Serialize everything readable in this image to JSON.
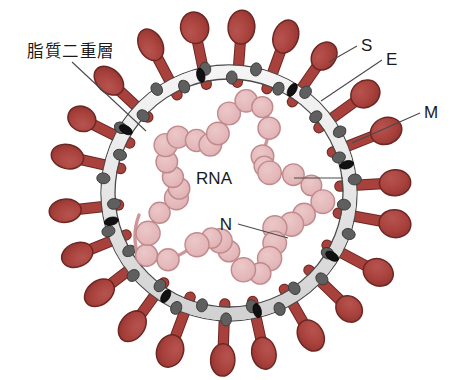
{
  "diagram": {
    "background_color": "#ffffff"
  },
  "labels": {
    "lipid_bilayer": "脂質二重層",
    "spike": "S",
    "envelope": "E",
    "membrane": "M",
    "rna": "RNA",
    "nucleocapsid": "N"
  },
  "colors": {
    "spike_fill": "#a8413c",
    "spike_stroke": "#6d2723",
    "membrane_band": "#e9e9e9",
    "membrane_stroke": "#4a4a4a",
    "m_protein": "#5f5f5f",
    "e_protein": "#111111",
    "n_protein_fill": "#e3b6b8",
    "n_protein_stroke": "#c08a8d",
    "rna_strand": "#cf9598",
    "leader_line": "#4a4a4a",
    "text": "#1a1a1a"
  },
  "geometry": {
    "center_x": 229,
    "center_y": 193,
    "membrane_outer_radius": 128,
    "membrane_inner_radius": 114,
    "spike_count": 22,
    "m_protein_count": 30,
    "e_protein_count": 8,
    "n_protein_count": 34
  },
  "leaders": [
    {
      "name": "lipid_bilayer",
      "x1": 72,
      "y1": 62,
      "x2": 146,
      "y2": 131
    },
    {
      "name": "spike",
      "x1": 357,
      "y1": 46,
      "x2": 329,
      "y2": 62
    },
    {
      "name": "envelope",
      "x1": 382,
      "y1": 60,
      "x2": 321,
      "y2": 101
    },
    {
      "name": "membrane",
      "x1": 420,
      "y1": 113,
      "x2": 352,
      "y2": 143
    },
    {
      "name": "rna",
      "x1": 294,
      "y1": 178,
      "x2": 343,
      "y2": 178
    },
    {
      "name": "nucleocapsid",
      "x1": 238,
      "y1": 224,
      "x2": 288,
      "y2": 238
    }
  ]
}
